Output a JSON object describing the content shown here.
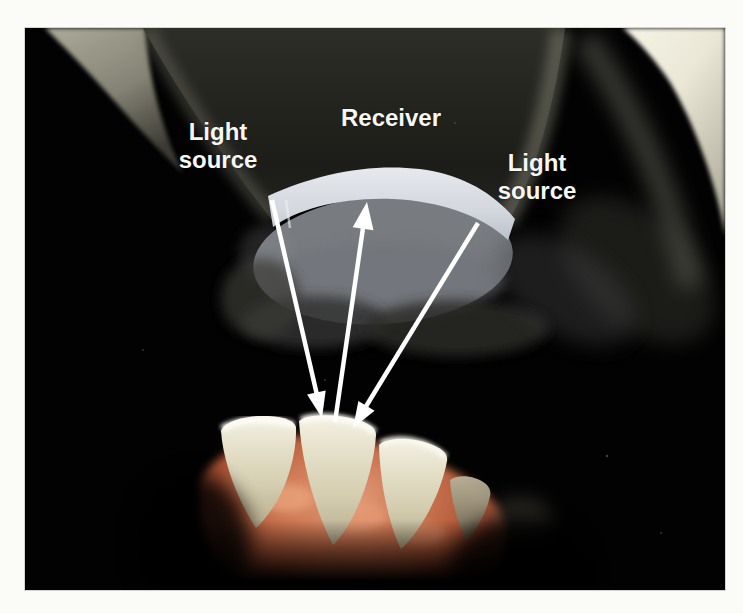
{
  "illustration": {
    "description": "3D rendered diagram of an intraoral scanner wand head projecting light beams onto lower front teeth; reflected beam returns to a receiver window",
    "background": "#000000",
    "labels": {
      "left_light_source": "Light source",
      "receiver": "Receiver",
      "right_light_source": "Light source"
    },
    "colors": {
      "annotation_white": "#ffffff",
      "scanner_window": "#d9dce2",
      "scanner_body_gray": "#84888f",
      "wand_dark": "#20201c",
      "wand_highlight_cream": "#f2f0e2",
      "teeth_ivory": "#ddd6bc",
      "gums_salmon": "#c06748",
      "page_margin": "#fbfbf8"
    }
  }
}
